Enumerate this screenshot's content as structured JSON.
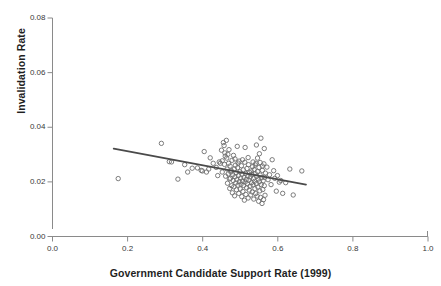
{
  "chart_data": {
    "type": "scatter",
    "title": "",
    "xlabel": "Government Candidate Support Rate (1999)",
    "ylabel": "Invalidation Rate",
    "xlim": [
      0.0,
      1.0
    ],
    "ylim": [
      0.0,
      0.08
    ],
    "xticks": [
      "0.0",
      "0.2",
      "0.4",
      "0.6",
      "0.8",
      "1.0"
    ],
    "xtick_values": [
      0.0,
      0.2,
      0.4,
      0.6,
      0.8,
      1.0
    ],
    "yticks": [
      "0.00",
      "0.02",
      "0.04",
      "0.06",
      "0.08"
    ],
    "ytick_values": [
      0.0,
      0.02,
      0.04,
      0.06,
      0.08
    ],
    "grid": false,
    "legend": null,
    "marker": {
      "shape": "open-circle",
      "size_px": 4.4,
      "stroke": "#6e6e6e",
      "fill": "none",
      "stroke_width": 0.9
    },
    "trendline": {
      "type": "linear-fit",
      "color": "#4a4a4a",
      "width": 1.8,
      "x_start": 0.163,
      "y_start": 0.0322,
      "x_end": 0.675,
      "y_end": 0.019
    },
    "series": [
      {
        "name": "municipalities",
        "points": [
          [
            0.175,
            0.0212
          ],
          [
            0.29,
            0.0341
          ],
          [
            0.311,
            0.0274
          ],
          [
            0.317,
            0.0273
          ],
          [
            0.334,
            0.021
          ],
          [
            0.352,
            0.0263
          ],
          [
            0.36,
            0.0236
          ],
          [
            0.372,
            0.025
          ],
          [
            0.386,
            0.0251
          ],
          [
            0.396,
            0.0242
          ],
          [
            0.399,
            0.024
          ],
          [
            0.404,
            0.0311
          ],
          [
            0.41,
            0.0236
          ],
          [
            0.416,
            0.0247
          ],
          [
            0.42,
            0.0288
          ],
          [
            0.428,
            0.0268
          ],
          [
            0.436,
            0.0253
          ],
          [
            0.44,
            0.0223
          ],
          [
            0.444,
            0.0273
          ],
          [
            0.447,
            0.0268
          ],
          [
            0.45,
            0.0316
          ],
          [
            0.452,
            0.0236
          ],
          [
            0.455,
            0.0344
          ],
          [
            0.457,
            0.0333
          ],
          [
            0.458,
            0.0264
          ],
          [
            0.46,
            0.0294
          ],
          [
            0.461,
            0.0221
          ],
          [
            0.463,
            0.0352
          ],
          [
            0.464,
            0.0287
          ],
          [
            0.465,
            0.0247
          ],
          [
            0.466,
            0.0195
          ],
          [
            0.468,
            0.0229
          ],
          [
            0.469,
            0.0268
          ],
          [
            0.47,
            0.0318
          ],
          [
            0.471,
            0.0211
          ],
          [
            0.472,
            0.0176
          ],
          [
            0.473,
            0.0258
          ],
          [
            0.474,
            0.0213
          ],
          [
            0.476,
            0.0241
          ],
          [
            0.477,
            0.0186
          ],
          [
            0.478,
            0.0279
          ],
          [
            0.479,
            0.016
          ],
          [
            0.48,
            0.0226
          ],
          [
            0.481,
            0.0205
          ],
          [
            0.482,
            0.0297
          ],
          [
            0.483,
            0.0182
          ],
          [
            0.484,
            0.0247
          ],
          [
            0.485,
            0.0149
          ],
          [
            0.486,
            0.0219
          ],
          [
            0.487,
            0.0261
          ],
          [
            0.488,
            0.0196
          ],
          [
            0.489,
            0.0233
          ],
          [
            0.49,
            0.0171
          ],
          [
            0.491,
            0.0208
          ],
          [
            0.492,
            0.033
          ],
          [
            0.493,
            0.0252
          ],
          [
            0.494,
            0.0188
          ],
          [
            0.495,
            0.0223
          ],
          [
            0.496,
            0.0158
          ],
          [
            0.497,
            0.0276
          ],
          [
            0.498,
            0.0201
          ],
          [
            0.499,
            0.0237
          ],
          [
            0.5,
            0.0174
          ],
          [
            0.501,
            0.0214
          ],
          [
            0.502,
            0.0191
          ],
          [
            0.503,
            0.0259
          ],
          [
            0.504,
            0.0146
          ],
          [
            0.505,
            0.0228
          ],
          [
            0.506,
            0.0203
          ],
          [
            0.507,
            0.0165
          ],
          [
            0.508,
            0.0244
          ],
          [
            0.509,
            0.0187
          ],
          [
            0.51,
            0.0216
          ],
          [
            0.511,
            0.0133
          ],
          [
            0.512,
            0.0272
          ],
          [
            0.513,
            0.0199
          ],
          [
            0.514,
            0.0231
          ],
          [
            0.515,
            0.0154
          ],
          [
            0.516,
            0.0209
          ],
          [
            0.517,
            0.0178
          ],
          [
            0.518,
            0.0249
          ],
          [
            0.519,
            0.0193
          ],
          [
            0.52,
            0.0222
          ],
          [
            0.521,
            0.0141
          ],
          [
            0.522,
            0.0263
          ],
          [
            0.523,
            0.0206
          ],
          [
            0.524,
            0.017
          ],
          [
            0.525,
            0.0234
          ],
          [
            0.526,
            0.0184
          ],
          [
            0.527,
            0.0218
          ],
          [
            0.528,
            0.0152
          ],
          [
            0.529,
            0.024
          ],
          [
            0.53,
            0.0197
          ],
          [
            0.531,
            0.0227
          ],
          [
            0.532,
            0.0163
          ],
          [
            0.533,
            0.0256
          ],
          [
            0.534,
            0.0189
          ],
          [
            0.535,
            0.0212
          ],
          [
            0.536,
            0.0137
          ],
          [
            0.537,
            0.0245
          ],
          [
            0.538,
            0.0202
          ],
          [
            0.539,
            0.0175
          ],
          [
            0.54,
            0.023
          ],
          [
            0.541,
            0.0157
          ],
          [
            0.542,
            0.0268
          ],
          [
            0.543,
            0.0194
          ],
          [
            0.544,
            0.022
          ],
          [
            0.545,
            0.0148
          ],
          [
            0.546,
            0.0238
          ],
          [
            0.547,
            0.0181
          ],
          [
            0.548,
            0.021
          ],
          [
            0.549,
            0.0129
          ],
          [
            0.55,
            0.0253
          ],
          [
            0.551,
            0.02
          ],
          [
            0.552,
            0.0167
          ],
          [
            0.553,
            0.0225
          ],
          [
            0.554,
            0.0143
          ],
          [
            0.555,
            0.036
          ],
          [
            0.556,
            0.019
          ],
          [
            0.557,
            0.0215
          ],
          [
            0.558,
            0.0121
          ],
          [
            0.559,
            0.0242
          ],
          [
            0.56,
            0.0172
          ],
          [
            0.561,
            0.0204
          ],
          [
            0.562,
            0.0135
          ],
          [
            0.563,
            0.0266
          ],
          [
            0.564,
            0.0186
          ],
          [
            0.565,
            0.0217
          ],
          [
            0.566,
            0.0151
          ],
          [
            0.567,
            0.0232
          ],
          [
            0.452,
            0.0277
          ],
          [
            0.459,
            0.0306
          ],
          [
            0.467,
            0.0301
          ],
          [
            0.475,
            0.0236
          ],
          [
            0.486,
            0.0284
          ],
          [
            0.494,
            0.0269
          ],
          [
            0.506,
            0.0281
          ],
          [
            0.513,
            0.0326
          ],
          [
            0.521,
            0.0289
          ],
          [
            0.534,
            0.0273
          ],
          [
            0.54,
            0.0262
          ],
          [
            0.546,
            0.0287
          ],
          [
            0.553,
            0.0271
          ],
          [
            0.559,
            0.0258
          ],
          [
            0.543,
            0.0335
          ],
          [
            0.551,
            0.0303
          ],
          [
            0.564,
            0.0322
          ],
          [
            0.571,
            0.0254
          ],
          [
            0.574,
            0.0208
          ],
          [
            0.578,
            0.0226
          ],
          [
            0.582,
            0.019
          ],
          [
            0.585,
            0.0281
          ],
          [
            0.589,
            0.0241
          ],
          [
            0.592,
            0.0213
          ],
          [
            0.596,
            0.0166
          ],
          [
            0.599,
            0.0223
          ],
          [
            0.604,
            0.0199
          ],
          [
            0.608,
            0.0205
          ],
          [
            0.613,
            0.0158
          ],
          [
            0.621,
            0.0197
          ],
          [
            0.632,
            0.0247
          ],
          [
            0.641,
            0.0152
          ],
          [
            0.664,
            0.024
          ]
        ]
      }
    ]
  }
}
